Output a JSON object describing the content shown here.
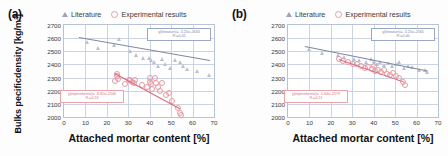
{
  "figure": {
    "panels": [
      {
        "label": "(a)",
        "ylabel": "Bulks pecificdensity [kg/m³]",
        "xlabel": "Attached mortar content [%]"
      },
      {
        "label": "(b)",
        "ylabel": "Satured dry-surface density [kg/m³]",
        "xlabel": "Attached mortar content [%]"
      }
    ],
    "legend": [
      {
        "label": "Literature",
        "marker": "triangle-marker",
        "color": "#9aa3b5"
      },
      {
        "label": "Experimental results",
        "marker": "circle-marker",
        "color": "#e8a0a8"
      }
    ],
    "colors": {
      "literature_line": "#7e8aa3",
      "experimental_line": "#d86a78",
      "grid": "#ccd4e4",
      "frame": "#b9c3d6"
    }
  },
  "chart_data": [
    {
      "type": "scatter",
      "panel": "(a)",
      "title": "Bulk specific density vs attached mortar content",
      "xlabel": "Attached mortar content [%]",
      "ylabel": "Bulks pecificdensity [kg/m³]",
      "xlim": [
        0,
        70
      ],
      "ylim": [
        2000,
        2700
      ],
      "xticks": [
        0,
        10,
        20,
        30,
        40,
        50,
        60,
        70
      ],
      "yticks": [
        2000,
        2100,
        2200,
        2300,
        2400,
        2500,
        2600,
        2700
      ],
      "grid": true,
      "legend_position": "above-plot",
      "series": [
        {
          "name": "Literature",
          "marker": "triangle",
          "color": "#b9c0cf",
          "points": [
            [
              10.5,
              2570
            ],
            [
              16.0,
              2525
            ],
            [
              23.5,
              2545
            ],
            [
              25.5,
              2590
            ],
            [
              31.0,
              2500
            ],
            [
              33.5,
              2470
            ],
            [
              37.0,
              2450
            ],
            [
              39.5,
              2452
            ],
            [
              40.5,
              2430
            ],
            [
              42.0,
              2415
            ],
            [
              44.0,
              2390
            ],
            [
              45.5,
              2440
            ],
            [
              47.0,
              2400
            ],
            [
              49.5,
              2370
            ],
            [
              52.0,
              2430
            ],
            [
              54.0,
              2420
            ],
            [
              55.5,
              2385
            ],
            [
              57.5,
              2365
            ],
            [
              62.0,
              2350
            ],
            [
              67.5,
              2320
            ]
          ],
          "fit": {
            "equation": "y(literature)= -3.25x+2633",
            "r2": "R²=0.42",
            "x_range": [
              7,
              68
            ],
            "y_range": [
              2610,
              2435
            ]
          }
        },
        {
          "name": "Experimental results",
          "marker": "circle",
          "color": "#e79aa4",
          "points": [
            [
              24.0,
              2275
            ],
            [
              24.5,
              2330
            ],
            [
              24.5,
              2310
            ],
            [
              25.0,
              2290
            ],
            [
              28.5,
              2250
            ],
            [
              30.5,
              2285
            ],
            [
              31.0,
              2280
            ],
            [
              31.5,
              2270
            ],
            [
              32.5,
              2260
            ],
            [
              33.0,
              2280
            ],
            [
              36.5,
              2240
            ],
            [
              38.5,
              2230
            ],
            [
              40.0,
              2300
            ],
            [
              40.0,
              2265
            ],
            [
              40.5,
              2250
            ],
            [
              41.0,
              2215
            ],
            [
              42.5,
              2300
            ],
            [
              43.0,
              2255
            ],
            [
              44.0,
              2225
            ],
            [
              45.0,
              2195
            ],
            [
              45.5,
              2255
            ],
            [
              47.5,
              2165
            ],
            [
              49.0,
              2185
            ],
            [
              50.5,
              2125
            ],
            [
              53.0,
              2065
            ],
            [
              54.0,
              2030
            ],
            [
              54.5,
              2015
            ]
          ],
          "fit": {
            "equation": "y(experimental)= -8.85x+2546",
            "r2": "R²=0.53",
            "x_range": [
              24,
              54.5
            ],
            "y_range": [
              2333,
              2063
            ]
          }
        }
      ]
    },
    {
      "type": "scatter",
      "panel": "(b)",
      "title": "Saturated surface-dry density vs attached mortar content",
      "xlabel": "Attached mortar content [%]",
      "ylabel": "Satured dry-surface density [kg/m³]",
      "xlim": [
        0,
        70
      ],
      "ylim": [
        2000,
        2700
      ],
      "xticks": [
        0,
        10,
        20,
        30,
        40,
        50,
        60,
        70
      ],
      "yticks": [
        2000,
        2100,
        2200,
        2300,
        2400,
        2500,
        2600,
        2700
      ],
      "grid": true,
      "legend_position": "above-plot",
      "series": [
        {
          "name": "Literature",
          "marker": "triangle",
          "color": "#b9c0cf",
          "points": [
            [
              10.0,
              2515
            ],
            [
              16.0,
              2490
            ],
            [
              23.5,
              2470
            ],
            [
              26.0,
              2455
            ],
            [
              31.0,
              2445
            ],
            [
              33.0,
              2430
            ],
            [
              36.5,
              2415
            ],
            [
              38.5,
              2440
            ],
            [
              40.0,
              2425
            ],
            [
              41.5,
              2400
            ],
            [
              43.0,
              2420
            ],
            [
              45.0,
              2395
            ],
            [
              46.5,
              2410
            ],
            [
              48.5,
              2385
            ],
            [
              50.5,
              2400
            ],
            [
              52.0,
              2415
            ],
            [
              54.0,
              2370
            ],
            [
              56.0,
              2390
            ],
            [
              58.0,
              2380
            ],
            [
              61.0,
              2360
            ],
            [
              64.0,
              2355
            ],
            [
              65.0,
              2345
            ]
          ],
          "fit": {
            "equation": "y(literature)= -3.25x+2565",
            "r2": "R²=0.40",
            "x_range": [
              8,
              65
            ],
            "y_range": [
              2539,
              2354
            ]
          }
        },
        {
          "name": "Experimental results",
          "marker": "circle",
          "color": "#e79aa4",
          "points": [
            [
              24.0,
              2440
            ],
            [
              25.5,
              2425
            ],
            [
              28.0,
              2415
            ],
            [
              30.5,
              2405
            ],
            [
              32.0,
              2400
            ],
            [
              34.0,
              2390
            ],
            [
              36.0,
              2375
            ],
            [
              37.5,
              2380
            ],
            [
              39.0,
              2365
            ],
            [
              40.0,
              2390
            ],
            [
              40.5,
              2350
            ],
            [
              42.0,
              2360
            ],
            [
              43.5,
              2340
            ],
            [
              45.0,
              2355
            ],
            [
              46.0,
              2330
            ],
            [
              47.5,
              2320
            ],
            [
              49.0,
              2335
            ],
            [
              50.5,
              2310
            ],
            [
              52.0,
              2300
            ],
            [
              53.5,
              2265
            ],
            [
              54.5,
              2240
            ]
          ],
          "fit": {
            "equation": "y(experimental)= -5.64x+2579",
            "r2": "R²=0.51",
            "x_range": [
              24,
              54.5
            ],
            "y_range": [
              2444,
              2271
            ]
          }
        }
      ]
    }
  ]
}
